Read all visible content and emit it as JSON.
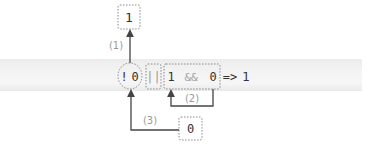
{
  "diagram": {
    "type": "operator-precedence-evaluation",
    "expression": {
      "not_group": {
        "operator": "!",
        "operand": "0"
      },
      "or_operator": "||",
      "and_group": {
        "left": "1",
        "operator": "&&",
        "right": "0"
      },
      "result_arrow": "=>",
      "result": "1"
    },
    "steps": [
      {
        "label": "(1)",
        "result": "1",
        "from": "not_group"
      },
      {
        "label": "(2)",
        "from": "and_group"
      },
      {
        "label": "(3)",
        "result": "0",
        "to": "not_group"
      }
    ],
    "colors": {
      "text": "#333333",
      "muted_text": "#9a9a9a",
      "dotted_border": "#888888",
      "arrow": "#444444",
      "band": "#f0f0f0"
    }
  }
}
